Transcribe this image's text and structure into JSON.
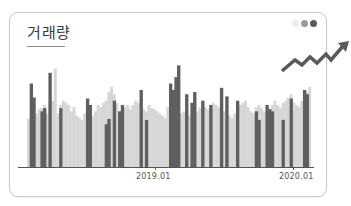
{
  "card": {
    "title": "거래량",
    "dots": [
      {
        "name": "dot-light",
        "color": "#ececec"
      },
      {
        "name": "dot-medium",
        "color": "#9a9a9a"
      },
      {
        "name": "dot-dark",
        "color": "#5a5a5a"
      }
    ],
    "trend_icon": "trend-up-arrow-icon"
  },
  "colors": {
    "dark_bar": "#5f5f5f",
    "light_bar": "#d6d6d6",
    "axis": "#555555",
    "border": "#c9c9c9"
  },
  "chart_data": {
    "type": "bar",
    "title": "거래량",
    "xlabel": "",
    "ylabel": "",
    "grid": false,
    "legend": null,
    "x_tick_labels": [
      "2019.01",
      "2020.01"
    ],
    "x_tick_positions": [
      0.455,
      0.94
    ],
    "ylim": [
      0,
      100
    ],
    "series": [
      {
        "name": "background",
        "color": "#d6d6d6",
        "values": [
          45,
          48,
          52,
          50,
          54,
          55,
          58,
          50,
          60,
          62,
          92,
          50,
          58,
          62,
          60,
          58,
          52,
          56,
          48,
          46,
          44,
          50,
          55,
          52,
          48,
          52,
          58,
          56,
          60,
          62,
          70,
          75,
          68,
          60,
          52,
          50,
          56,
          58,
          54,
          58,
          62,
          60,
          56,
          54,
          52,
          58,
          55,
          54,
          52,
          50,
          48,
          46,
          56,
          50,
          54,
          52,
          55,
          50,
          52,
          50,
          48,
          46,
          50,
          52,
          55,
          58,
          56,
          54,
          52,
          60,
          58,
          56,
          54,
          52,
          50,
          48,
          46,
          50,
          54,
          58,
          60,
          62,
          56,
          52,
          50,
          56,
          58,
          55,
          52,
          50,
          54,
          58,
          62,
          58,
          55,
          60,
          62,
          65,
          68,
          60,
          58,
          56,
          62,
          65,
          70,
          75
        ]
      },
      {
        "name": "foreground",
        "color": "#5f5f5f",
        "values": [
          0,
          78,
          65,
          0,
          0,
          52,
          55,
          0,
          88,
          0,
          0,
          0,
          55,
          0,
          0,
          0,
          0,
          0,
          0,
          0,
          0,
          0,
          64,
          58,
          0,
          0,
          0,
          0,
          0,
          40,
          45,
          0,
          62,
          0,
          52,
          58,
          0,
          0,
          0,
          0,
          0,
          0,
          72,
          0,
          44,
          0,
          0,
          0,
          0,
          0,
          0,
          0,
          0,
          78,
          72,
          84,
          95,
          0,
          0,
          68,
          0,
          60,
          70,
          0,
          0,
          62,
          0,
          0,
          58,
          0,
          0,
          0,
          74,
          0,
          66,
          0,
          0,
          0,
          62,
          0,
          0,
          0,
          0,
          0,
          0,
          52,
          44,
          0,
          0,
          58,
          54,
          52,
          0,
          0,
          0,
          44,
          0,
          0,
          64,
          0,
          0,
          0,
          0,
          72,
          68,
          0
        ]
      }
    ]
  }
}
